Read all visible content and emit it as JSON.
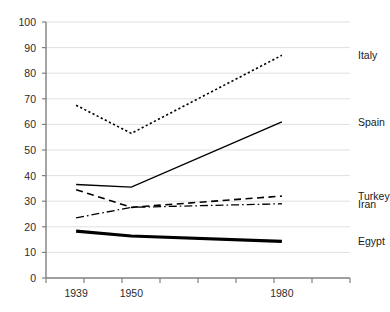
{
  "chart_data": {
    "type": "line",
    "title": "",
    "subtitle": "",
    "xlabel": "",
    "ylabel": "",
    "x": [
      1939,
      1950,
      1980
    ],
    "x_tick_labels": [
      "1939",
      "1950",
      "1980"
    ],
    "xlim": [
      1933,
      1986
    ],
    "ylim": [
      0,
      100
    ],
    "y_ticks": [
      0,
      10,
      20,
      30,
      40,
      50,
      60,
      70,
      80,
      90,
      100
    ],
    "y_tick_labels": [
      "0",
      "10",
      "20",
      "30",
      "40",
      "50",
      "60",
      "70",
      "80",
      "90",
      "100"
    ],
    "grid": "horizontal",
    "legend_position": "right-of-line-ends",
    "series": [
      {
        "name": "Italy",
        "label": "Italy",
        "style": "dotted",
        "color": "#000000",
        "width": 1.6,
        "values": [
          67.5,
          56.5,
          87.0
        ]
      },
      {
        "name": "Spain",
        "label": "Spain",
        "style": "solid",
        "color": "#000000",
        "width": 1.4,
        "values": [
          36.5,
          35.5,
          61.0
        ]
      },
      {
        "name": "Turkey",
        "label": "Turkey",
        "style": "dashed",
        "color": "#000000",
        "width": 1.6,
        "values": [
          34.5,
          27.6,
          32.0
        ]
      },
      {
        "name": "Iran",
        "label": "Iran",
        "style": "dash-dot",
        "color": "#000000",
        "width": 1.3,
        "values": [
          23.5,
          27.6,
          29.0
        ]
      },
      {
        "name": "Egypt",
        "label": "Egypt",
        "style": "solid-thick",
        "color": "#000000",
        "width": 3.2,
        "values": [
          18.3,
          16.4,
          14.3
        ]
      }
    ]
  },
  "axes": {
    "axis_color": "#808080",
    "grid_color": "#e0e0e0"
  }
}
